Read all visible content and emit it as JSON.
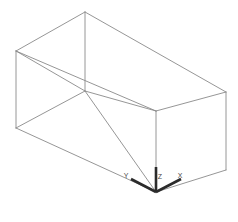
{
  "viewport": {
    "width": 238,
    "height": 222,
    "background": "#ffffff",
    "name": "3d-model-viewport"
  },
  "model": {
    "name": "Rectangular Prism",
    "shape_type": "cuboid",
    "projection": "isometric",
    "render_mode": "wireframe",
    "edge_color": "#8a8a8a",
    "edge_width": 0.9,
    "vertices": {
      "top_back": [
        85,
        12
      ],
      "top_left": [
        16,
        51
      ],
      "top_center": [
        85,
        91
      ],
      "top_right": [
        226,
        92
      ],
      "bottom_left": [
        16,
        128
      ],
      "bottom_center": [
        156,
        192
      ],
      "bottom_right": [
        226,
        170
      ],
      "bottom_front_right": [
        156,
        111
      ]
    },
    "edges": [
      {
        "name": "top-back-left",
        "from": [
          85,
          12
        ],
        "to": [
          16,
          51
        ]
      },
      {
        "name": "top-back-right",
        "from": [
          85,
          12
        ],
        "to": [
          226,
          92
        ]
      },
      {
        "name": "top-front-left",
        "from": [
          16,
          51
        ],
        "to": [
          156,
          111
        ]
      },
      {
        "name": "top-front-right",
        "from": [
          156,
          111
        ],
        "to": [
          226,
          92
        ]
      },
      {
        "name": "top-mid-diagonal",
        "from": [
          85,
          12
        ],
        "to": [
          85,
          91
        ]
      },
      {
        "name": "top-inner-left",
        "from": [
          85,
          91
        ],
        "to": [
          16,
          51
        ]
      },
      {
        "name": "top-inner-right",
        "from": [
          85,
          91
        ],
        "to": [
          156,
          111
        ]
      },
      {
        "name": "vertical-left",
        "from": [
          16,
          51
        ],
        "to": [
          16,
          128
        ]
      },
      {
        "name": "vertical-center",
        "from": [
          156,
          111
        ],
        "to": [
          156,
          192
        ]
      },
      {
        "name": "vertical-right",
        "from": [
          226,
          92
        ],
        "to": [
          226,
          170
        ]
      },
      {
        "name": "bottom-front-left",
        "from": [
          16,
          128
        ],
        "to": [
          156,
          192
        ]
      },
      {
        "name": "bottom-front-right",
        "from": [
          156,
          192
        ],
        "to": [
          226,
          170
        ]
      },
      {
        "name": "bottom-back-left",
        "from": [
          85,
          91
        ],
        "to": [
          16,
          128
        ]
      },
      {
        "name": "bottom-back-right",
        "from": [
          85,
          91
        ],
        "to": [
          156,
          192
        ]
      }
    ]
  },
  "axis_triad": {
    "name": "coordinate-axis-indicator",
    "origin": [
      156,
      192
    ],
    "color": "#2b2b2b",
    "stroke_width": 2.6,
    "axes": [
      {
        "id": "z",
        "label": "Z",
        "tip": [
          156,
          167
        ],
        "label_pos": [
          160,
          179
        ]
      },
      {
        "id": "y",
        "label": "Y",
        "tip": [
          131,
          179
        ],
        "label_pos": [
          126,
          178
        ]
      },
      {
        "id": "x",
        "label": "X",
        "tip": [
          181,
          179
        ],
        "label_pos": [
          180,
          178
        ]
      }
    ]
  }
}
